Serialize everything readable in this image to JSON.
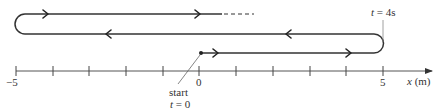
{
  "figure": {
    "type": "motion-diagram",
    "axis": {
      "label_var": "x",
      "label_unit": "(m)",
      "tick_min": -5,
      "tick_max": 5,
      "tick_step": 1,
      "labeled_ticks": [
        "−5",
        "0",
        "5"
      ]
    },
    "annotations": {
      "start_label": "start",
      "start_time_var": "t",
      "start_time_eq": " = 0",
      "turn_time_var": "t",
      "turn_time_eq": " = 4s"
    },
    "path": {
      "start_x": 0,
      "turn1_x": 5,
      "turn1_time": "4s",
      "turn2_x": -5,
      "continues_dashed": true
    },
    "colors": {
      "stroke": "#333333",
      "axis": "#555555"
    }
  }
}
